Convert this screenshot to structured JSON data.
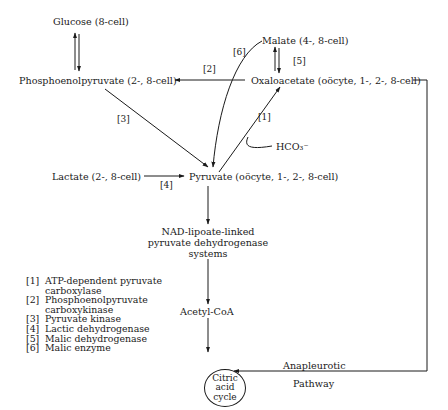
{
  "nodes": {
    "glucose": "Glucose (8-cell)",
    "pep": "Phosphoenolpyruvate (2-, 8-cell)",
    "malate": "Malate (4-, 8-cell)",
    "oxaloacetate": "Oxaloacetate (oöcyte, 1-, 2-, 8-cell)",
    "bicarbonate": "HCO₃⁻",
    "lactate": "Lactate (2-, 8-cell)",
    "pyruvate": "Pyruvate (oöcyte, 1-, 2-, 8-cell)",
    "pdh_line1": "NAD-lipoate-linked",
    "pdh_line2": "pyruvate dehydrogenase",
    "pdh_line3": "systems",
    "acetyl_coa": "Acetyl-CoA",
    "tca_line1": "Citric",
    "tca_line2": "acid",
    "tca_line3": "cycle"
  },
  "edge_labels": {
    "e1": "[1]",
    "e2": "[2]",
    "e3": "[3]",
    "e4": "[4]",
    "e5": "[5]",
    "e6": "[6]",
    "anaplerotic_line1": "Anapleurotic",
    "anaplerotic_line2": "Pathway"
  },
  "legend": [
    {
      "key": "[1]",
      "lines": [
        "ATP-dependent pyruvate",
        "carboxylase"
      ]
    },
    {
      "key": "[2]",
      "lines": [
        "Phosphoenolpyruvate",
        "carboxykinase"
      ]
    },
    {
      "key": "[3]",
      "lines": [
        "Pyruvate kinase"
      ]
    },
    {
      "key": "[4]",
      "lines": [
        "Lactic dehydrogenase"
      ]
    },
    {
      "key": "[5]",
      "lines": [
        "Malic dehydrogenase"
      ]
    },
    {
      "key": "[6]",
      "lines": [
        "Malic enzyme"
      ]
    }
  ]
}
